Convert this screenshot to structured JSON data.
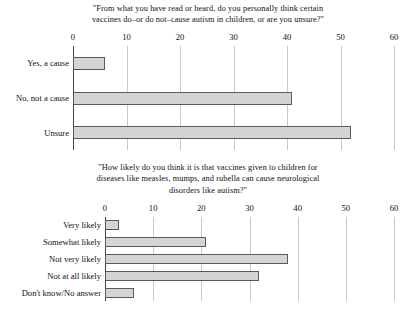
{
  "chart_data": [
    {
      "type": "bar",
      "orientation": "horizontal",
      "title": "\"From what you have read or heard, do you personally think certain vaccines do–or do not–cause autism in children, or are you unsure?\"",
      "title_lines": [
        "\"From what you have read or heard, do you personally think certain",
        "vaccines do–or do not–cause autism in children, or are you unsure?\""
      ],
      "categories": [
        "Yes, a cause",
        "No, not a cause",
        "Unsure"
      ],
      "values": [
        6,
        41,
        52
      ],
      "xlabel": "",
      "ylabel": "",
      "xlim": [
        0,
        60
      ],
      "xticks": [
        0,
        10,
        20,
        30,
        40,
        50,
        60
      ],
      "xtick_labels": [
        "0",
        "10",
        "20",
        "30",
        "40",
        "50",
        "60"
      ],
      "grid": true,
      "legend": false,
      "bar_fill": "#d4d4d4",
      "bar_edge": "#5a5a5a"
    },
    {
      "type": "bar",
      "orientation": "horizontal",
      "title": "\"How likely do you think it is that vaccines given to children for diseases like measles, mumps, and rubella can cause neurological disorders like autism?\"",
      "title_lines": [
        "\"How likely do you think it is that vaccines given to children for",
        "diseases like measles, mumps, and rubella can cause neurological",
        "disorders like autism?\""
      ],
      "categories": [
        "Very likely",
        "Somewhat likely",
        "Not very likely",
        "Not at all likely",
        "Don't know/No answer"
      ],
      "values": [
        3,
        21,
        38,
        32,
        6
      ],
      "xlabel": "",
      "ylabel": "",
      "xlim": [
        0,
        60
      ],
      "xticks": [
        0,
        10,
        20,
        30,
        40,
        50,
        60
      ],
      "xtick_labels": [
        "0",
        "10",
        "20",
        "30",
        "40",
        "50",
        "60"
      ],
      "grid": true,
      "legend": false,
      "bar_fill": "#d4d4d4",
      "bar_edge": "#5a5a5a"
    }
  ]
}
